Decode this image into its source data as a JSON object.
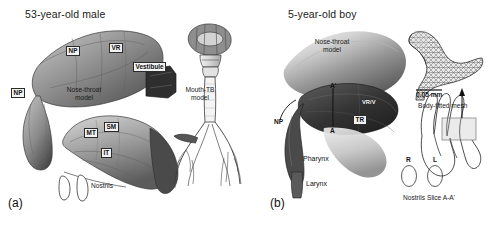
{
  "figure": {
    "type": "anatomical-model-diagram",
    "background": "#ffffff",
    "panels": [
      {
        "id": "a",
        "caption": "(a)",
        "title": "53-year-old male",
        "labels": {
          "np_upper": "NP",
          "np_lower": "NP",
          "vr": "VR",
          "vestibule": "Vestibule",
          "nose_throat_line1": "Nose-throat",
          "nose_throat_line2": "model",
          "mt": "MT",
          "sm": "SM",
          "it": "IT",
          "nostrils": "Nostrils",
          "mouth_tb_line1": "Mouth-TB",
          "mouth_tb_line2": "model"
        }
      },
      {
        "id": "b",
        "caption": "(b)",
        "title": "5-year-old boy",
        "labels": {
          "nose_throat_line1": "Nose-throat",
          "nose_throat_line2": "model",
          "a_prime": "A'",
          "a": "A",
          "tr": "TR",
          "np": "NP",
          "vr_v": "VR/V",
          "pharynx": "Pharynx",
          "larynx": "Larynx",
          "nostril_r": "R",
          "nostril_l": "L",
          "nostrils": "Nostrils",
          "scale_bar": "0.05 mm",
          "body_fitted_mesh": "Body-fitted mesh",
          "slice": "Slice A-A'"
        }
      }
    ]
  },
  "colors": {
    "ink": "#1a1a1a",
    "outline": "#444444",
    "model_dark": "#3c3c3c",
    "model_mid": "#8f8f8f",
    "model_light": "#d8d8d8",
    "tag_bg": "#f2f2f2"
  }
}
